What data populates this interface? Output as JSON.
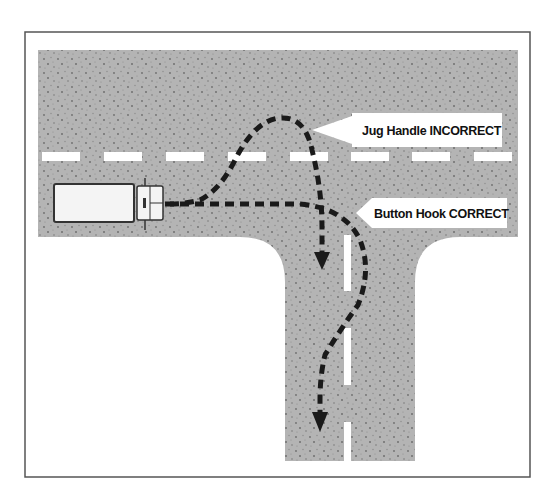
{
  "figure": {
    "type": "road-turn-diagram",
    "colors": {
      "frame": "#555555",
      "road": "#b4b4b4",
      "road_speckle": "#7a7a7a",
      "lane_marking": "#ffffff",
      "path": "#1a1a1a",
      "truck_body": "#f4f4f4",
      "truck_outline": "#333333",
      "label_bg": "#ffffff",
      "label_text": "#111111"
    }
  },
  "labels": {
    "incorrect": {
      "text": "Jug Handle INCORRECT",
      "name": "Jug Handle",
      "verdict": "INCORRECT"
    },
    "correct": {
      "text": "Button Hook CORRECT",
      "name": "Button Hook",
      "verdict": "CORRECT"
    }
  },
  "paths": [
    {
      "id": "jug-handle",
      "verdict": "incorrect",
      "description": "Swings left across the center line, loops up and back down into the side road"
    },
    {
      "id": "button-hook",
      "verdict": "correct",
      "description": "Proceeds straight, then hooks right into the side road, curving into the correct lane"
    }
  ],
  "vehicle": {
    "type": "truck",
    "heading": "east"
  }
}
